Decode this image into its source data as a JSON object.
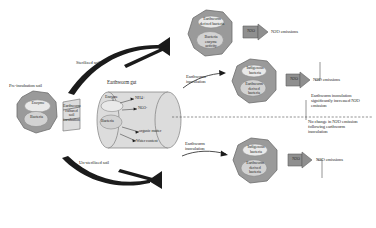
{
  "figure": {
    "type": "flow-diagram"
  },
  "colors": {
    "blob": "#9a9a9a",
    "blob_outline": "#6d6d6d",
    "inner_light": "#e9e9e9",
    "inner_dark": "#d2d2d2",
    "cylinder": "#dcdcdc",
    "arrow_black": "#1b1b1b",
    "box_grey": "#8f8f8f",
    "text": "#2b2b2b"
  },
  "left": {
    "pre_incubation_label": "Pre-incubation soil",
    "soil_inner_top": "Enzyme",
    "soil_inner_bottom": "Bacteria",
    "transition_box": "Earthworm\ncultured\nsoil\nincubation"
  },
  "gut": {
    "title": "Earthworm gut",
    "inner_top": "Enzyme",
    "inner_bottom": "Bacteria",
    "annotations": [
      {
        "text": "NH4+"
      },
      {
        "text": "NO3-"
      },
      {
        "text": "organic matter"
      },
      {
        "text": "Water content"
      }
    ],
    "left_labels": [
      "Enzyme",
      "Bacteria"
    ]
  },
  "arrows": {
    "sterilized_soil": "Sterilized soil",
    "unsterilized_soil": "Un-sterilized soil",
    "earthworm_inoculation_upper": "Earthworm\ninoculation",
    "earthworm_inoculation_lower": "Earthworm\ninoculation"
  },
  "pathways": [
    {
      "id": "sterilized-no-inoculation",
      "blob_inner_top": "Earthworm\nderived bacteria",
      "blob_inner_bottom": "Bacteria\nenzyme\nactivity",
      "emission_box": "N2O",
      "emission_label": "N2O emissions",
      "conclusion": ""
    },
    {
      "id": "sterilized-with-inoculation",
      "blob_inner_top": "Indigenous\nbacteria",
      "blob_inner_bottom": "Earthworm\nderived\nbacteria",
      "emission_box": "N2O",
      "emission_label": "N2O emissions",
      "conclusion": "Earthworm inoculation\nsignificantly increased N2O\nemission"
    },
    {
      "id": "unsterilized-with-inoculation",
      "blob_inner_top": "Indigenous\nbacteria",
      "blob_inner_bottom": "Earthworm\nderived\nbacteria",
      "emission_box": "N2O",
      "emission_label": "N2O emissions",
      "conclusion": "No change in N2O emission\nfollowing earthworm\ninoculation"
    }
  ]
}
